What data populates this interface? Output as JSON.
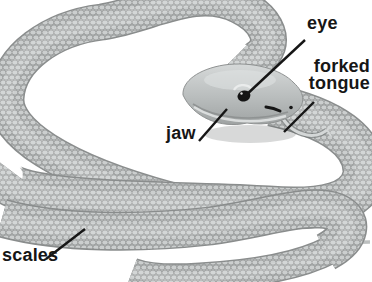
{
  "diagram": {
    "labels": {
      "eye": "eye",
      "forked_tongue": "forked\ntongue",
      "jaw": "jaw",
      "scales": "scales"
    },
    "colors": {
      "background": "#ffffff",
      "body_fill": "#c4c7c7",
      "scale_fill": "#cbcece",
      "scale_outline": "#8f9292",
      "body_edge": "#8a8d8d",
      "head_highlight": "#d8dbdb",
      "head_shadow": "#9fa3a3",
      "eye_color": "#141414",
      "label_text": "#161616",
      "leader_line": "#161616"
    }
  }
}
